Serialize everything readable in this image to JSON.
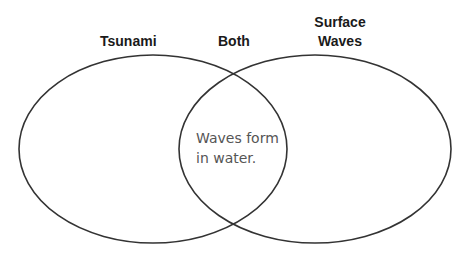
{
  "diagram": {
    "type": "venn",
    "labels": {
      "left": "Tsunami",
      "middle": "Both",
      "right_line1": "Surface",
      "right_line2": "Waves"
    },
    "regions": {
      "left_only": "",
      "intersection_line1": "Waves form",
      "intersection_line2": "in water.",
      "right_only": ""
    },
    "colors": {
      "outline": "#333333",
      "label_text": "#1a1a1a",
      "body_text": "#555555",
      "background": "#ffffff"
    }
  }
}
